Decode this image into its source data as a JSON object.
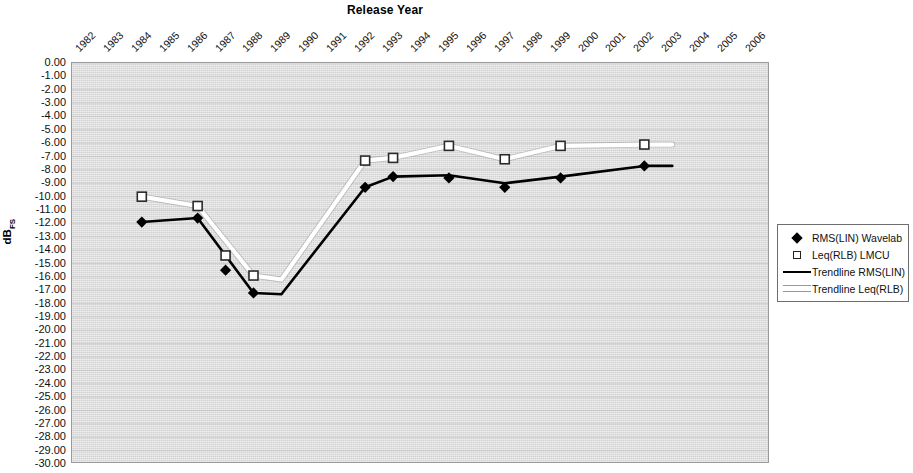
{
  "chart": {
    "title": "Release Year",
    "y_axis_title_main": "dB",
    "y_axis_title_sub": "FS"
  },
  "legend": {
    "items": [
      {
        "label": "RMS(LIN) Wavelab",
        "marker": "filled-diamond",
        "color": "#000000"
      },
      {
        "label": "Leq(RLB) LMCU",
        "marker": "open-square",
        "color": "#ffffff"
      },
      {
        "label": "Trendline RMS(LIN)",
        "marker": "black-line",
        "color": "#000000"
      },
      {
        "label": "Trendline Leq(RLB)",
        "marker": "white-line",
        "color": "#ffffff"
      }
    ]
  },
  "chart_data": {
    "type": "line",
    "title": "Release Year",
    "xlabel": "Release Year",
    "ylabel": "dBFS",
    "grid": true,
    "legend_position": "right",
    "xlim": [
      1982,
      2006
    ],
    "ylim": [
      -30,
      0
    ],
    "categories": [
      "1982",
      "1983",
      "1984",
      "1985",
      "1986",
      "1987",
      "1988",
      "1989",
      "1990",
      "1991",
      "1992",
      "1993",
      "1994",
      "1995",
      "1996",
      "1997",
      "1998",
      "1999",
      "2000",
      "2001",
      "2002",
      "2003",
      "2004",
      "2005",
      "2006"
    ],
    "ytick_labels": [
      "0.00",
      "-1.00",
      "-2.00",
      "-3.00",
      "-4.00",
      "-5.00",
      "-6.00",
      "-7.00",
      "-8.00",
      "-9.00",
      "-10.00",
      "-11.00",
      "-12.00",
      "-13.00",
      "-14.00",
      "-15.00",
      "-16.00",
      "-17.00",
      "-18.00",
      "-19.00",
      "-20.00",
      "-21.00",
      "-22.00",
      "-23.00",
      "-24.00",
      "-25.00",
      "-26.00",
      "-27.00",
      "-28.00",
      "-29.00",
      "-30.00"
    ],
    "ytick_values": [
      0,
      -1,
      -2,
      -3,
      -4,
      -5,
      -6,
      -7,
      -8,
      -9,
      -10,
      -11,
      -12,
      -13,
      -14,
      -15,
      -16,
      -17,
      -18,
      -19,
      -20,
      -21,
      -22,
      -23,
      -24,
      -25,
      -26,
      -27,
      -28,
      -29,
      -30
    ],
    "series": [
      {
        "name": "RMS(LIN) Wavelab",
        "marker": "filled-diamond",
        "color": "#000000",
        "points": [
          {
            "x": 1984,
            "y": -11.9
          },
          {
            "x": 1986,
            "y": -11.6
          },
          {
            "x": 1987,
            "y": -15.5
          },
          {
            "x": 1988,
            "y": -17.2
          },
          {
            "x": 1992,
            "y": -9.3
          },
          {
            "x": 1993,
            "y": -8.5
          },
          {
            "x": 1995,
            "y": -8.6
          },
          {
            "x": 1997,
            "y": -9.3
          },
          {
            "x": 1999,
            "y": -8.6
          },
          {
            "x": 2002,
            "y": -7.7
          }
        ]
      },
      {
        "name": "Leq(RLB) LMCU",
        "marker": "open-square",
        "color": "#ffffff",
        "points": [
          {
            "x": 1984,
            "y": -10.0
          },
          {
            "x": 1986,
            "y": -10.7
          },
          {
            "x": 1987,
            "y": -14.4
          },
          {
            "x": 1988,
            "y": -15.9
          },
          {
            "x": 1992,
            "y": -7.3
          },
          {
            "x": 1993,
            "y": -7.1
          },
          {
            "x": 1995,
            "y": -6.2
          },
          {
            "x": 1997,
            "y": -7.2
          },
          {
            "x": 1999,
            "y": -6.2
          },
          {
            "x": 2002,
            "y": -6.1
          }
        ]
      },
      {
        "name": "Trendline RMS(LIN)",
        "marker": "line",
        "color": "#000000",
        "points": [
          {
            "x": 1984,
            "y": -11.9
          },
          {
            "x": 1986,
            "y": -11.6
          },
          {
            "x": 1988,
            "y": -17.2
          },
          {
            "x": 1989,
            "y": -17.3
          },
          {
            "x": 1992,
            "y": -9.3
          },
          {
            "x": 1993,
            "y": -8.5
          },
          {
            "x": 1995,
            "y": -8.4
          },
          {
            "x": 1997,
            "y": -9.0
          },
          {
            "x": 1999,
            "y": -8.5
          },
          {
            "x": 2002,
            "y": -7.7
          },
          {
            "x": 2003,
            "y": -7.7
          }
        ]
      },
      {
        "name": "Trendline Leq(RLB)",
        "marker": "line",
        "color": "#ffffff",
        "points": [
          {
            "x": 1984,
            "y": -10.0
          },
          {
            "x": 1986,
            "y": -10.7
          },
          {
            "x": 1988,
            "y": -15.9
          },
          {
            "x": 1989,
            "y": -16.2
          },
          {
            "x": 1992,
            "y": -7.3
          },
          {
            "x": 1993,
            "y": -7.1
          },
          {
            "x": 1995,
            "y": -6.2
          },
          {
            "x": 1997,
            "y": -7.2
          },
          {
            "x": 1999,
            "y": -6.2
          },
          {
            "x": 2002,
            "y": -6.1
          },
          {
            "x": 2003,
            "y": -6.1
          }
        ]
      }
    ]
  }
}
